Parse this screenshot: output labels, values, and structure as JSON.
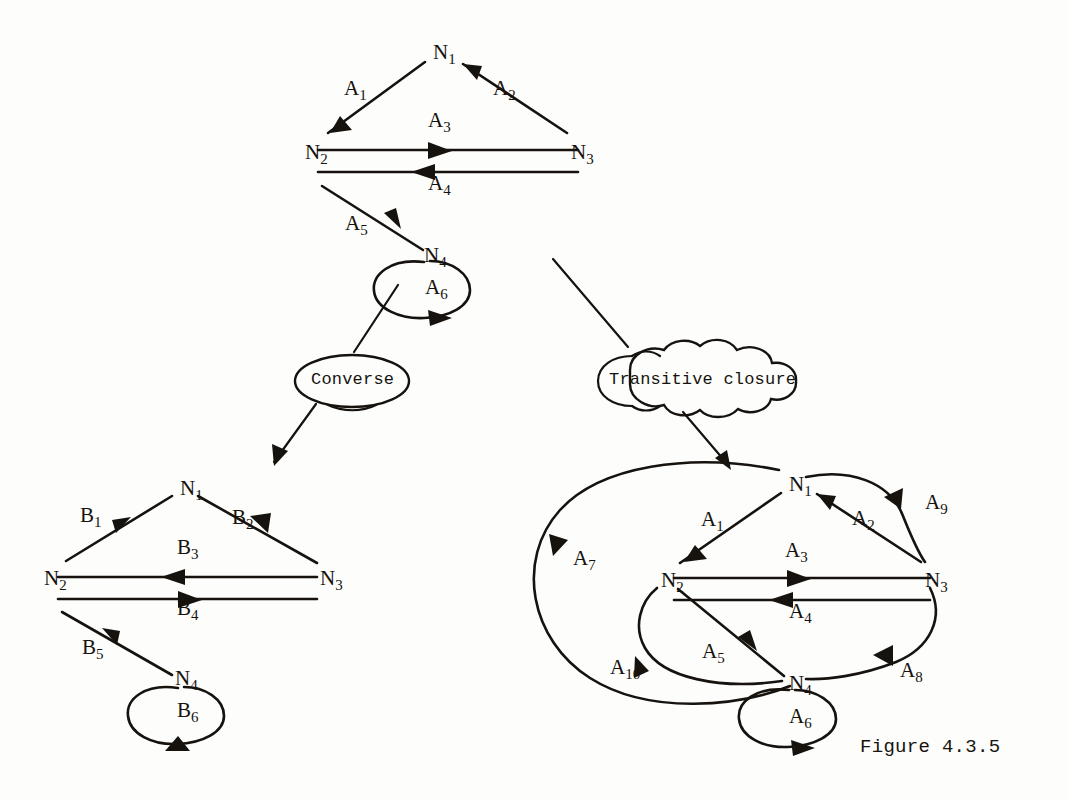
{
  "figure": {
    "caption": "Figure 4.3.5"
  },
  "operators": {
    "converse_label": "Converse",
    "transitive_label": "Transitive closure"
  },
  "colors": {
    "ink": "#16130f",
    "paper": "#fdfdfb"
  },
  "graphs": {
    "original": {
      "name": "original-graph",
      "nodes": [
        {
          "id": "N1",
          "base": "N",
          "sub": "1",
          "x": 433,
          "y": 42
        },
        {
          "id": "N2",
          "base": "N",
          "sub": "2",
          "x": 305,
          "y": 142
        },
        {
          "id": "N3",
          "base": "N",
          "sub": "3",
          "x": 571,
          "y": 142
        },
        {
          "id": "N4",
          "base": "N",
          "sub": "4",
          "x": 424,
          "y": 245
        }
      ],
      "arcs": [
        {
          "id": "A1",
          "base": "A",
          "sub": "1",
          "x": 344,
          "y": 78,
          "from": "N1",
          "to": "N2"
        },
        {
          "id": "A2",
          "base": "A",
          "sub": "2",
          "x": 493,
          "y": 78,
          "from": "N3",
          "to": "N1"
        },
        {
          "id": "A3",
          "base": "A",
          "sub": "3",
          "x": 428,
          "y": 110,
          "from": "N2",
          "to": "N3"
        },
        {
          "id": "A4",
          "base": "A",
          "sub": "4",
          "x": 428,
          "y": 173,
          "from": "N3",
          "to": "N2"
        },
        {
          "id": "A5",
          "base": "A",
          "sub": "5",
          "x": 345,
          "y": 213,
          "from": "N2",
          "to": "N4"
        },
        {
          "id": "A6",
          "base": "A",
          "sub": "6",
          "x": 425,
          "y": 277,
          "from": "N4",
          "to": "N4"
        }
      ]
    },
    "converse": {
      "name": "converse-graph",
      "nodes": [
        {
          "id": "N1",
          "base": "N",
          "sub": "1",
          "x": 180,
          "y": 478
        },
        {
          "id": "N2",
          "base": "N",
          "sub": "2",
          "x": 44,
          "y": 568
        },
        {
          "id": "N3",
          "base": "N",
          "sub": "3",
          "x": 320,
          "y": 568
        },
        {
          "id": "N4",
          "base": "N",
          "sub": "4",
          "x": 175,
          "y": 668
        }
      ],
      "arcs": [
        {
          "id": "B1",
          "base": "B",
          "sub": "1",
          "x": 80,
          "y": 505,
          "from": "N2",
          "to": "N1"
        },
        {
          "id": "B2",
          "base": "B",
          "sub": "2",
          "x": 232,
          "y": 507,
          "from": "N1",
          "to": "N3"
        },
        {
          "id": "B3",
          "base": "B",
          "sub": "3",
          "x": 177,
          "y": 537,
          "from": "N3",
          "to": "N2"
        },
        {
          "id": "B4",
          "base": "B",
          "sub": "4",
          "x": 177,
          "y": 598,
          "from": "N2",
          "to": "N3"
        },
        {
          "id": "B5",
          "base": "B",
          "sub": "5",
          "x": 82,
          "y": 637,
          "from": "N4",
          "to": "N2"
        },
        {
          "id": "B6",
          "base": "B",
          "sub": "6",
          "x": 177,
          "y": 700,
          "from": "N4",
          "to": "N4"
        }
      ]
    },
    "transitive_closure": {
      "name": "transitive-closure-graph",
      "nodes": [
        {
          "id": "N1",
          "base": "N",
          "sub": "1",
          "x": 789,
          "y": 474
        },
        {
          "id": "N2",
          "base": "N",
          "sub": "2",
          "x": 661,
          "y": 570
        },
        {
          "id": "N3",
          "base": "N",
          "sub": "3",
          "x": 925,
          "y": 570
        },
        {
          "id": "N4",
          "base": "N",
          "sub": "4",
          "x": 789,
          "y": 673
        }
      ],
      "arcs": [
        {
          "id": "A1",
          "base": "A",
          "sub": "1",
          "x": 701,
          "y": 509,
          "from": "N1",
          "to": "N2"
        },
        {
          "id": "A2",
          "base": "A",
          "sub": "2",
          "x": 852,
          "y": 508,
          "from": "N3",
          "to": "N1"
        },
        {
          "id": "A3",
          "base": "A",
          "sub": "3",
          "x": 785,
          "y": 540,
          "from": "N2",
          "to": "N3"
        },
        {
          "id": "A4",
          "base": "A",
          "sub": "4",
          "x": 789,
          "y": 601,
          "from": "N3",
          "to": "N2"
        },
        {
          "id": "A5",
          "base": "A",
          "sub": "5",
          "x": 702,
          "y": 641,
          "from": "N2",
          "to": "N4"
        },
        {
          "id": "A6",
          "base": "A",
          "sub": "6",
          "x": 789,
          "y": 706,
          "from": "N4",
          "to": "N4"
        },
        {
          "id": "A7",
          "base": "A",
          "sub": "7",
          "x": 573,
          "y": 548,
          "from": "N1",
          "to": "N4"
        },
        {
          "id": "A8",
          "base": "A",
          "sub": "8",
          "x": 900,
          "y": 660,
          "from": "N3",
          "to": "N4"
        },
        {
          "id": "A9",
          "base": "A",
          "sub": "9",
          "x": 925,
          "y": 492,
          "from": "N1",
          "to": "N3"
        },
        {
          "id": "A10",
          "base": "A",
          "sub": "10",
          "x": 610,
          "y": 657,
          "from": "N4",
          "to": "N2"
        }
      ]
    }
  }
}
